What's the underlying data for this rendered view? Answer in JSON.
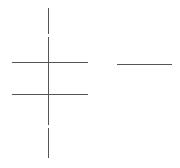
{
  "canvas": {
    "width": 180,
    "height": 168,
    "background": "#ffffff"
  },
  "line_color": "#555555",
  "lines": [
    {
      "id": "vertical-line",
      "orientation": "vertical",
      "x": 48,
      "y1": 8,
      "y2": 158
    },
    {
      "id": "horizontal-line-upper-left",
      "orientation": "horizontal",
      "y": 62,
      "x1": 12,
      "x2": 88
    },
    {
      "id": "horizontal-line-right",
      "orientation": "horizontal",
      "y": 64,
      "x1": 117,
      "x2": 172
    },
    {
      "id": "horizontal-line-lower-left",
      "orientation": "horizontal",
      "y": 94,
      "x1": 12,
      "x2": 88
    }
  ],
  "gaps": [
    {
      "x": 47,
      "y": 34,
      "w": 3,
      "h": 3
    },
    {
      "x": 47,
      "y": 125,
      "w": 3,
      "h": 3
    }
  ]
}
